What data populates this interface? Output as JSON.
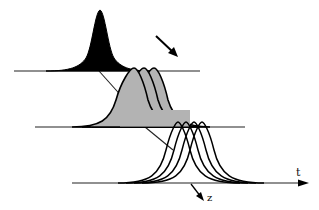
{
  "diagram": {
    "type": "pulse propagation schematic",
    "axes": [
      {
        "name": "top-axis",
        "y": 71,
        "x_start": 14,
        "x_end": 200
      },
      {
        "name": "middle-axis",
        "y": 127,
        "x_start": 35,
        "x_end": 245
      },
      {
        "name": "bottom-axis",
        "y": 183,
        "x_start": 72,
        "x_end": 302
      }
    ],
    "labels": {
      "t_axis": "t",
      "z_axis": "z"
    },
    "stages": [
      {
        "name": "input-pulse",
        "fill": "#000000",
        "count": 1
      },
      {
        "name": "split-pulses",
        "fill": "#b0b0b0",
        "count": 3
      },
      {
        "name": "output-pulses",
        "fill": "#ffffff",
        "count": 4
      }
    ],
    "colors": {
      "ink": "#111111",
      "grey_fill": "#b0b0b0",
      "background": "#ffffff"
    }
  }
}
